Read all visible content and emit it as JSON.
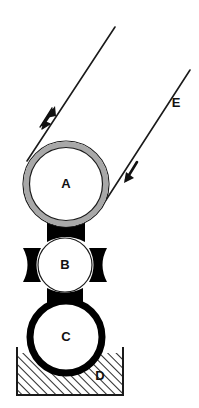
{
  "figure": {
    "kind": "roll-coating-schematic",
    "background_color": "#ffffff",
    "stroke_color": "#1a1a1a",
    "ring_gray": "#a8a8a8",
    "fill_white": "#ffffff",
    "hatch_color": "#2b2b2b",
    "nip_black": "#000000"
  },
  "labels": {
    "roll_a": "A",
    "roll_b": "B",
    "roll_c": "C",
    "tank_d": "D",
    "web_e": "E"
  },
  "components": {
    "roll_a": {
      "name": "A",
      "cx": 66,
      "cy": 184,
      "r": 43,
      "ring_width": 6,
      "style": "gray-ring"
    },
    "roll_b": {
      "name": "B",
      "cx": 65,
      "cy": 265,
      "r": 27,
      "ring_width": 1,
      "style": "thin-outline",
      "nips": [
        "top",
        "bottom",
        "left",
        "right"
      ]
    },
    "roll_c": {
      "name": "C",
      "cx": 66,
      "cy": 337,
      "r": 36,
      "ring_width": 7,
      "style": "thick-black-ring"
    },
    "tank_d": {
      "name": "D",
      "x": 17,
      "y": 352,
      "width": 106,
      "height": 44,
      "fill": "diagonal-hatch",
      "label_x": 100,
      "label_y": 377
    }
  },
  "web": {
    "name": "E",
    "label_x": 176,
    "label_y": 104,
    "incoming_line": {
      "x1": 190,
      "y1": 70,
      "x2": 106,
      "y2": 200
    },
    "outgoing_line": {
      "x1": 115,
      "y1": 27,
      "x2": 27,
      "y2": 161
    },
    "arrows": [
      {
        "name": "outgoing-arrow",
        "x": 46,
        "y": 117,
        "direction": "up-right"
      },
      {
        "name": "incoming-arrow",
        "x": 130,
        "y": 172,
        "direction": "down-left"
      }
    ]
  },
  "nip_shapes": {
    "a_b": {
      "cx": 66,
      "cy": 232,
      "half_width": 19,
      "half_height": 10
    },
    "b_c": {
      "cx": 65,
      "cy": 297,
      "half_width": 18,
      "half_height": 9
    },
    "b_left": {
      "cx": 32,
      "cy": 265,
      "half_width": 9,
      "half_height": 17
    },
    "b_right": {
      "cx": 98,
      "cy": 265,
      "half_width": 9,
      "half_height": 17
    }
  }
}
